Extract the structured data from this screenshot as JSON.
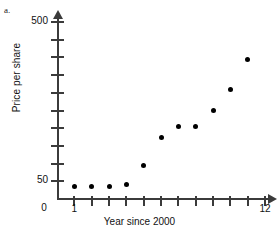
{
  "panel": {
    "label": "a."
  },
  "chart_data": {
    "type": "scatter",
    "title": "",
    "xlabel": "Year since 2000",
    "ylabel": "Price per share",
    "x": [
      1,
      2,
      3,
      4,
      5,
      6,
      7,
      8,
      9,
      10,
      11
    ],
    "values": [
      35,
      35,
      35,
      42,
      95,
      175,
      205,
      205,
      250,
      310,
      395
    ],
    "xlim": [
      0,
      12
    ],
    "ylim": [
      0,
      500
    ],
    "xticks": [
      1,
      2,
      3,
      4,
      5,
      6,
      7,
      8,
      9,
      10,
      11,
      12
    ],
    "xtick_labels": [
      "1",
      "",
      "",
      "",
      "",
      "",
      "",
      "",
      "",
      "",
      "",
      "12"
    ],
    "yticks": [
      0,
      50,
      100,
      150,
      200,
      250,
      300,
      350,
      400,
      450,
      500
    ],
    "ytick_labels": [
      "0",
      "50",
      "",
      "",
      "",
      "",
      "",
      "",
      "",
      "",
      "500"
    ],
    "grid": false,
    "legend": null,
    "marker": "filled-circle",
    "marker_color": "#000000",
    "axis_color": "#3b3b3b"
  }
}
